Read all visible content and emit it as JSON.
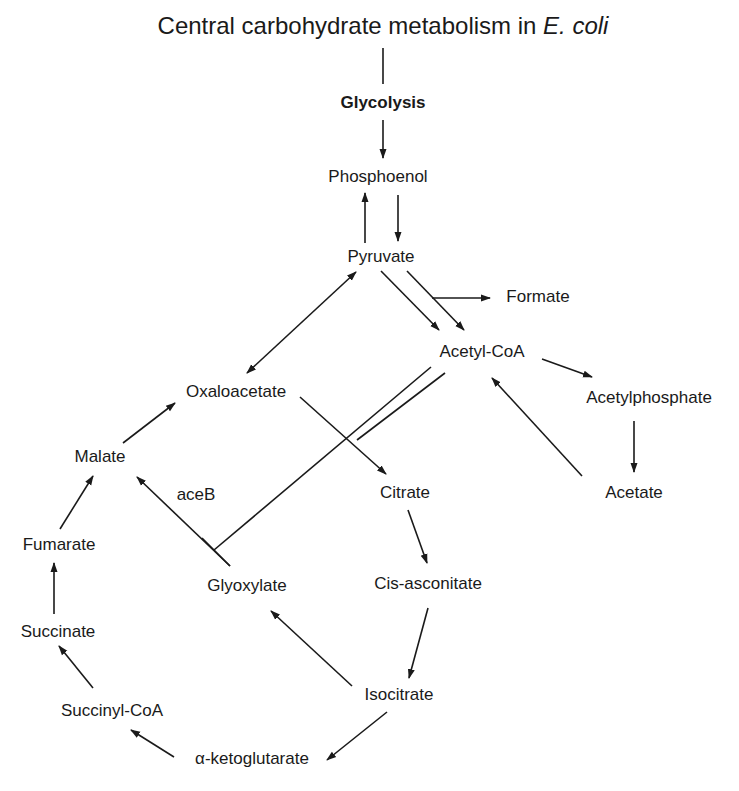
{
  "title": {
    "main": "Central carbohydrate metabolism in ",
    "organism": "E. coli"
  },
  "nodes": {
    "glycolysis": {
      "label": "Glycolysis",
      "x": 383,
      "y": 108
    },
    "phosphoenol": {
      "label": "Phosphoenol",
      "x": 378,
      "y": 182
    },
    "pyruvate": {
      "label": "Pyruvate",
      "x": 381,
      "y": 262
    },
    "formate": {
      "label": "Formate",
      "x": 538,
      "y": 302
    },
    "acetyl_coa": {
      "label": "Acetyl-CoA",
      "x": 482,
      "y": 357
    },
    "oxaloacetate": {
      "label": "Oxaloacetate",
      "x": 236,
      "y": 397
    },
    "acetylphosphate": {
      "label": "Acetylphosphate",
      "x": 649,
      "y": 403
    },
    "malate": {
      "label": "Malate",
      "x": 100,
      "y": 462
    },
    "acetate": {
      "label": "Acetate",
      "x": 634,
      "y": 498
    },
    "aceb": {
      "label": "aceB",
      "x": 196,
      "y": 500
    },
    "citrate": {
      "label": "Citrate",
      "x": 405,
      "y": 498
    },
    "fumarate": {
      "label": "Fumarate",
      "x": 59,
      "y": 550
    },
    "glyoxylate": {
      "label": "Glyoxylate",
      "x": 247,
      "y": 591
    },
    "cis_asconitate": {
      "label": "Cis-asconitate",
      "x": 428,
      "y": 589
    },
    "succinate": {
      "label": "Succinate",
      "x": 58,
      "y": 637
    },
    "isocitrate": {
      "label": "Isocitrate",
      "x": 399,
      "y": 700
    },
    "succinyl_coa": {
      "label": "Succinyl-CoA",
      "x": 112,
      "y": 716
    },
    "alpha_ketoglutarate": {
      "label": "α-ketoglutarate",
      "x": 252,
      "y": 764
    }
  },
  "edges": [
    {
      "from": "title",
      "to": "glycolysis",
      "type": "line",
      "x1": 383,
      "y1": 48,
      "x2": 383,
      "y2": 84
    },
    {
      "from": "glycolysis",
      "to": "phosphoenol",
      "type": "arrow",
      "x1": 383,
      "y1": 120,
      "x2": 383,
      "y2": 158
    },
    {
      "from": "pyruvate",
      "to": "phosphoenol",
      "type": "arrow",
      "x1": 365,
      "y1": 243,
      "x2": 365,
      "y2": 193
    },
    {
      "from": "phosphoenol",
      "to": "pyruvate",
      "type": "arrow",
      "x1": 398,
      "y1": 195,
      "x2": 398,
      "y2": 241
    },
    {
      "from": "oxaloacetate",
      "to": "pyruvate",
      "type": "double-arrow",
      "x1": 247,
      "y1": 373,
      "x2": 356,
      "y2": 272
    },
    {
      "from": "pyruvate",
      "to": "acetyl_coa",
      "type": "arrow",
      "x1": 381,
      "y1": 271,
      "x2": 439,
      "y2": 330
    },
    {
      "from": "pyruvate",
      "to": "acetyl_coa",
      "type": "arrow",
      "x1": 407,
      "y1": 271,
      "x2": 464,
      "y2": 330
    },
    {
      "from": "pyruvate",
      "to": "formate",
      "type": "arrow",
      "x1": 432,
      "y1": 298,
      "x2": 490,
      "y2": 298
    },
    {
      "from": "acetyl_coa",
      "to": "acetylphosphate",
      "type": "arrow",
      "x1": 542,
      "y1": 359,
      "x2": 592,
      "y2": 377
    },
    {
      "from": "acetylphosphate",
      "to": "acetate",
      "type": "arrow",
      "x1": 634,
      "y1": 421,
      "x2": 634,
      "y2": 472
    },
    {
      "from": "acetate",
      "to": "acetyl_coa",
      "type": "arrow",
      "x1": 582,
      "y1": 476,
      "x2": 492,
      "y2": 378
    },
    {
      "from": "malate",
      "to": "oxaloacetate",
      "type": "arrow",
      "x1": 123,
      "y1": 443,
      "x2": 175,
      "y2": 403
    },
    {
      "from": "oxaloacetate",
      "to": "citrate",
      "type": "arrow",
      "x1": 300,
      "y1": 397,
      "x2": 386,
      "y2": 474
    },
    {
      "from": "acetyl_coa",
      "to": "glyoxylate-junction",
      "type": "double-line-a",
      "x1": 431,
      "y1": 367,
      "x2": 214,
      "y2": 550
    },
    {
      "from": "acetyl_coa",
      "to": "oxaloacetate-citrate-junction",
      "type": "double-line-b",
      "x1": 445,
      "y1": 373,
      "x2": 357,
      "y2": 440
    },
    {
      "from": "glyoxylate",
      "to": "malate",
      "type": "arrow",
      "x1": 230,
      "y1": 566,
      "x2": 137,
      "y2": 477
    },
    {
      "from": "fumarate",
      "to": "malate",
      "type": "arrow",
      "x1": 60,
      "y1": 529,
      "x2": 93,
      "y2": 476
    },
    {
      "from": "succinate",
      "to": "fumarate",
      "type": "arrow",
      "x1": 54,
      "y1": 614,
      "x2": 54,
      "y2": 563
    },
    {
      "from": "succinyl_coa",
      "to": "succinate",
      "type": "arrow",
      "x1": 93,
      "y1": 688,
      "x2": 59,
      "y2": 646
    },
    {
      "from": "citrate",
      "to": "cis_asconitate",
      "type": "arrow",
      "x1": 408,
      "y1": 510,
      "x2": 427,
      "y2": 563
    },
    {
      "from": "cis_asconitate",
      "to": "isocitrate",
      "type": "arrow",
      "x1": 428,
      "y1": 608,
      "x2": 409,
      "y2": 678
    },
    {
      "from": "isocitrate",
      "to": "glyoxylate",
      "type": "arrow",
      "x1": 352,
      "y1": 686,
      "x2": 271,
      "y2": 611
    },
    {
      "from": "isocitrate",
      "to": "alpha_ketoglutarate",
      "type": "arrow",
      "x1": 387,
      "y1": 712,
      "x2": 327,
      "y2": 760
    },
    {
      "from": "alpha_ketoglutarate",
      "to": "succinyl_coa",
      "type": "arrow",
      "x1": 174,
      "y1": 757,
      "x2": 131,
      "y2": 730
    }
  ],
  "colors": {
    "ink": "#1a1a1a",
    "background": "#ffffff"
  }
}
